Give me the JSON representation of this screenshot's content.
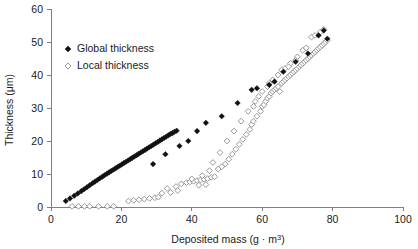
{
  "chart_data": {
    "type": "scatter",
    "title": "",
    "xlabel": "Deposited mass (g · m3)",
    "xlabel_base": "Deposited mass (g · m",
    "xlabel_sup": "3",
    "xlabel_close": ")",
    "ylabel": "Thickness (μm)",
    "xlim": [
      0,
      100
    ],
    "ylim": [
      0,
      60
    ],
    "xticks": [
      0,
      20,
      40,
      60,
      80,
      100
    ],
    "yticks": [
      0,
      10,
      20,
      30,
      40,
      50,
      60
    ],
    "grid": false,
    "legend_position": "upper-left-inside",
    "series": [
      {
        "name": "Global thickness",
        "marker": "filled-diamond",
        "color": "#111111",
        "points": [
          [
            4.2,
            1.8
          ],
          [
            5.4,
            2.6
          ],
          [
            6.6,
            3.4
          ],
          [
            7.6,
            4.1
          ],
          [
            8.6,
            4.8
          ],
          [
            9.4,
            5.4
          ],
          [
            10.2,
            6.0
          ],
          [
            11.0,
            6.6
          ],
          [
            11.8,
            7.2
          ],
          [
            12.5,
            7.7
          ],
          [
            13.2,
            8.2
          ],
          [
            13.9,
            8.7
          ],
          [
            14.6,
            9.2
          ],
          [
            15.2,
            9.6
          ],
          [
            15.9,
            10.1
          ],
          [
            16.5,
            10.5
          ],
          [
            17.1,
            10.9
          ],
          [
            17.7,
            11.3
          ],
          [
            18.3,
            11.7
          ],
          [
            18.9,
            12.1
          ],
          [
            19.5,
            12.5
          ],
          [
            20.1,
            12.9
          ],
          [
            20.7,
            13.3
          ],
          [
            21.3,
            13.7
          ],
          [
            21.9,
            14.1
          ],
          [
            22.5,
            14.5
          ],
          [
            23.1,
            14.9
          ],
          [
            23.7,
            15.3
          ],
          [
            24.3,
            15.7
          ],
          [
            24.9,
            16.1
          ],
          [
            25.5,
            16.5
          ],
          [
            26.1,
            16.9
          ],
          [
            26.7,
            17.3
          ],
          [
            27.3,
            17.7
          ],
          [
            27.9,
            18.1
          ],
          [
            28.5,
            18.5
          ],
          [
            29.1,
            18.9
          ],
          [
            29.7,
            19.3
          ],
          [
            30.3,
            19.7
          ],
          [
            30.9,
            20.1
          ],
          [
            31.5,
            20.5
          ],
          [
            32.1,
            20.9
          ],
          [
            32.7,
            21.3
          ],
          [
            33.3,
            21.7
          ],
          [
            33.9,
            22.1
          ],
          [
            34.5,
            22.4
          ],
          [
            35.1,
            22.8
          ],
          [
            35.7,
            23.1
          ],
          [
            29.0,
            13.0
          ],
          [
            32.5,
            16.0
          ],
          [
            36.5,
            18.5
          ],
          [
            39.0,
            20.0
          ],
          [
            41.5,
            23.0
          ],
          [
            44.0,
            25.5
          ],
          [
            48.5,
            27.5
          ],
          [
            53.0,
            31.5
          ],
          [
            57.0,
            35.5
          ],
          [
            58.5,
            36.0
          ],
          [
            62.0,
            37.0
          ],
          [
            63.5,
            38.0
          ],
          [
            66.0,
            41.0
          ],
          [
            69.5,
            44.0
          ],
          [
            73.0,
            46.5
          ],
          [
            78.5,
            51.0
          ],
          [
            77.5,
            53.5
          ],
          [
            76.0,
            52.0
          ]
        ]
      },
      {
        "name": "Local thickness",
        "marker": "open-diamond",
        "color": "#8c8c8c",
        "points": [
          [
            6.0,
            0.2
          ],
          [
            7.8,
            0.2
          ],
          [
            9.5,
            0.2
          ],
          [
            11.0,
            0.2
          ],
          [
            13.5,
            0.2
          ],
          [
            16.0,
            0.2
          ],
          [
            17.8,
            0.2
          ],
          [
            22.0,
            1.8
          ],
          [
            23.5,
            2.0
          ],
          [
            25.0,
            2.2
          ],
          [
            26.5,
            2.4
          ],
          [
            28.0,
            2.6
          ],
          [
            29.5,
            2.8
          ],
          [
            31.5,
            4.2
          ],
          [
            33.0,
            5.6
          ],
          [
            34.0,
            4.4
          ],
          [
            35.5,
            6.2
          ],
          [
            37.0,
            7.0
          ],
          [
            38.5,
            7.4
          ],
          [
            39.5,
            7.6
          ],
          [
            40.5,
            7.8
          ],
          [
            41.5,
            8.0
          ],
          [
            42.5,
            8.2
          ],
          [
            43.5,
            8.4
          ],
          [
            44.5,
            8.6
          ],
          [
            42.0,
            6.6
          ],
          [
            44.0,
            6.8
          ],
          [
            45.5,
            9.0
          ],
          [
            46.5,
            9.2
          ],
          [
            47.5,
            11.5
          ],
          [
            48.5,
            12.2
          ],
          [
            49.5,
            13.0
          ],
          [
            50.5,
            14.5
          ],
          [
            51.5,
            16.0
          ],
          [
            52.5,
            17.5
          ],
          [
            53.5,
            19.0
          ],
          [
            54.5,
            20.5
          ],
          [
            55.5,
            22.0
          ],
          [
            56.5,
            23.5
          ],
          [
            57.0,
            25.0
          ],
          [
            57.5,
            26.0
          ],
          [
            58.5,
            27.5
          ],
          [
            59.5,
            29.0
          ],
          [
            60.0,
            30.5
          ],
          [
            60.5,
            31.0
          ],
          [
            61.0,
            32.0
          ],
          [
            61.5,
            33.0
          ],
          [
            62.0,
            33.5
          ],
          [
            62.5,
            34.5
          ],
          [
            63.0,
            35.0
          ],
          [
            63.5,
            35.5
          ],
          [
            64.0,
            36.0
          ],
          [
            64.5,
            36.5
          ],
          [
            65.0,
            35.0
          ],
          [
            65.5,
            37.5
          ],
          [
            66.0,
            38.0
          ],
          [
            66.5,
            38.5
          ],
          [
            67.0,
            39.0
          ],
          [
            67.5,
            39.5
          ],
          [
            68.0,
            40.0
          ],
          [
            68.5,
            40.5
          ],
          [
            69.0,
            41.0
          ],
          [
            69.5,
            41.5
          ],
          [
            70.0,
            42.0
          ],
          [
            70.5,
            42.5
          ],
          [
            71.0,
            43.0
          ],
          [
            71.5,
            43.5
          ],
          [
            72.0,
            44.0
          ],
          [
            72.5,
            44.5
          ],
          [
            73.0,
            45.0
          ],
          [
            73.5,
            45.5
          ],
          [
            74.0,
            46.0
          ],
          [
            74.5,
            46.5
          ],
          [
            75.0,
            47.0
          ],
          [
            75.5,
            47.5
          ],
          [
            76.0,
            48.0
          ],
          [
            76.5,
            48.5
          ],
          [
            77.0,
            49.0
          ],
          [
            77.5,
            49.5
          ],
          [
            78.0,
            50.0
          ],
          [
            78.5,
            50.5
          ],
          [
            74.0,
            51.5
          ],
          [
            75.0,
            52.0
          ],
          [
            76.5,
            53.0
          ],
          [
            77.5,
            53.8
          ],
          [
            71.5,
            47.5
          ],
          [
            72.5,
            48.2
          ],
          [
            70.0,
            45.5
          ],
          [
            68.0,
            43.5
          ],
          [
            66.5,
            42.0
          ],
          [
            64.5,
            40.0
          ],
          [
            62.0,
            37.5
          ],
          [
            60.0,
            35.0
          ],
          [
            58.0,
            32.0
          ],
          [
            56.0,
            29.0
          ],
          [
            54.0,
            26.0
          ],
          [
            52.0,
            23.0
          ],
          [
            50.0,
            20.0
          ],
          [
            48.0,
            16.5
          ],
          [
            46.0,
            13.5
          ],
          [
            45.0,
            11.0
          ],
          [
            43.0,
            9.5
          ],
          [
            40.0,
            8.5
          ],
          [
            36.0,
            5.0
          ],
          [
            30.5,
            3.0
          ],
          [
            63.0,
            38.5
          ],
          [
            65.5,
            41.5
          ],
          [
            67.5,
            42.5
          ],
          [
            69.5,
            44.5
          ],
          [
            59.0,
            33.5
          ],
          [
            61.5,
            36.5
          ],
          [
            57.5,
            30.5
          ]
        ]
      }
    ]
  },
  "legend": {
    "entries": [
      {
        "label": "Global thickness",
        "marker": "filled-diamond"
      },
      {
        "label": "Local thickness",
        "marker": "open-diamond"
      }
    ]
  },
  "colors": {
    "global": "#111111",
    "local": "#8c8c8c",
    "axis": "#808080",
    "text": "#1a1a1a",
    "background": "#ffffff"
  }
}
